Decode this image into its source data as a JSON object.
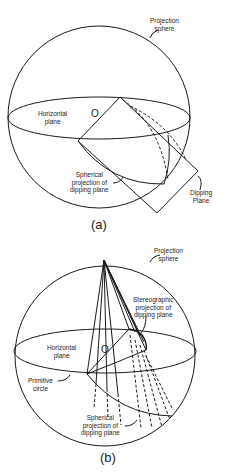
{
  "figure_a": {
    "caption": "(a)",
    "labels": {
      "projection_sphere_1": "Projection",
      "projection_sphere_2": "sphere",
      "horizontal_plane_1": "Horizontal",
      "horizontal_plane_2": "plane",
      "origin": "O",
      "spherical_projection_1": "Spherical",
      "spherical_projection_2": "projection of",
      "spherical_projection_3": "dipping plane",
      "dipping_plane_1": "Dipping",
      "dipping_plane_2": "Plane"
    }
  },
  "figure_b": {
    "caption": "(b)",
    "labels": {
      "projection_sphere_1": "Projection",
      "projection_sphere_2": "sphere",
      "stereographic_1": "Stereographic",
      "stereographic_2": "projection of",
      "stereographic_3": "dipping plane",
      "horizontal_plane_1": "Horizontal",
      "horizontal_plane_2": "plane",
      "origin": "O",
      "primitive_circle_1": "Primitive",
      "primitive_circle_2": "circle",
      "spherical_projection_1": "Spherical",
      "spherical_projection_2": "projection of",
      "spherical_projection_3": "dipping plane"
    }
  }
}
